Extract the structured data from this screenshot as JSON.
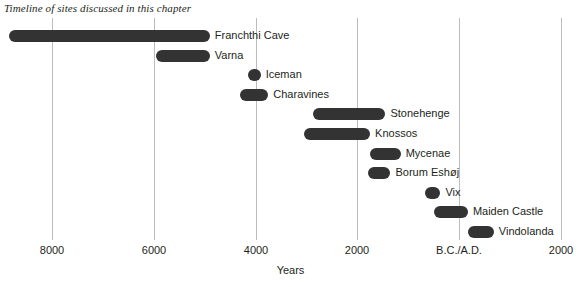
{
  "chart_data": {
    "type": "bar",
    "orientation": "horizontal",
    "title": "Timeline of sites discussed in this chapter",
    "xlabel": "Years",
    "ylabel": "",
    "grid": true,
    "legend": "none",
    "x_axis": {
      "ticks": [
        {
          "label": "8000",
          "value": -8000
        },
        {
          "label": "6000",
          "value": -6000
        },
        {
          "label": "4000",
          "value": -4000
        },
        {
          "label": "2000",
          "value": -2000
        },
        {
          "label": "B.C./A.D.",
          "value": 0
        },
        {
          "label": "2000",
          "value": 2000
        }
      ],
      "xlim": [
        -8000,
        2000
      ],
      "note": "Negative values are B.C., positive values are A.D."
    },
    "categories": [
      "Franchthi Cave",
      "Varna",
      "Iceman",
      "Charavines",
      "Stonehenge",
      "Knossos",
      "Mycenae",
      "Borum Eshøj",
      "Vix",
      "Maiden Castle",
      "Vindolanda"
    ],
    "bars": [
      {
        "label": "Franchthi Cave",
        "start": -8850,
        "end": -4900
      },
      {
        "label": "Varna",
        "start": -5950,
        "end": -4900
      },
      {
        "label": "Iceman",
        "start": -4150,
        "end": -3900
      },
      {
        "label": "Charavines",
        "start": -4300,
        "end": -3750
      },
      {
        "label": "Stonehenge",
        "start": -2880,
        "end": -1450
      },
      {
        "label": "Knossos",
        "start": -3050,
        "end": -1750
      },
      {
        "label": "Mycenae",
        "start": -1750,
        "end": -1150
      },
      {
        "label": "Borum Eshøj",
        "start": -1800,
        "end": -1350
      },
      {
        "label": "Vix",
        "start": -680,
        "end": -370
      },
      {
        "label": "Maiden Castle",
        "start": -500,
        "end": 170
      },
      {
        "label": "Vindolanda",
        "start": 170,
        "end": 680
      }
    ]
  },
  "colors": {
    "bar": "#333333",
    "gridline": "#bcbcbc",
    "text": "#231f20",
    "background": "#ffffff"
  }
}
